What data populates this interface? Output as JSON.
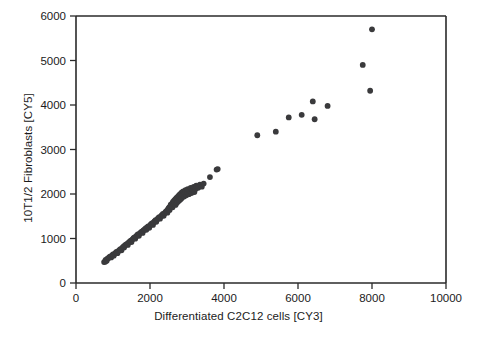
{
  "chart_data": {
    "type": "scatter",
    "title": "",
    "xlabel": "Differentiated C2C12 cells [CY3]",
    "ylabel": "10T1/2 Fibroblasts [CY5]",
    "xlim": [
      0,
      10000
    ],
    "ylim": [
      0,
      6000
    ],
    "xticks": [
      0,
      2000,
      4000,
      6000,
      8000,
      10000
    ],
    "yticks": [
      0,
      1000,
      2000,
      3000,
      4000,
      5000,
      6000
    ],
    "xtick_labels": [
      "0",
      "2000",
      "4000",
      "6000",
      "8000",
      "10000"
    ],
    "ytick_labels": [
      "0",
      "1000",
      "2000",
      "3000",
      "4000",
      "5000",
      "6000"
    ],
    "grid": false,
    "legend": false,
    "marker": "circle",
    "marker_color": "#3a3a3c",
    "marker_size": 5,
    "series": [
      {
        "name": "samples",
        "points": [
          [
            760,
            470
          ],
          [
            790,
            480
          ],
          [
            800,
            520
          ],
          [
            830,
            500
          ],
          [
            850,
            545
          ],
          [
            880,
            560
          ],
          [
            900,
            580
          ],
          [
            930,
            600
          ],
          [
            950,
            575
          ],
          [
            980,
            620
          ],
          [
            1000,
            640
          ],
          [
            1020,
            615
          ],
          [
            1050,
            660
          ],
          [
            1080,
            685
          ],
          [
            1100,
            700
          ],
          [
            1120,
            670
          ],
          [
            1150,
            720
          ],
          [
            1180,
            745
          ],
          [
            1200,
            760
          ],
          [
            1230,
            735
          ],
          [
            1250,
            790
          ],
          [
            1280,
            815
          ],
          [
            1300,
            800
          ],
          [
            1320,
            845
          ],
          [
            1350,
            860
          ],
          [
            1380,
            880
          ],
          [
            1400,
            855
          ],
          [
            1420,
            905
          ],
          [
            1450,
            930
          ],
          [
            1480,
            950
          ],
          [
            1500,
            920
          ],
          [
            1520,
            975
          ],
          [
            1550,
            1000
          ],
          [
            1570,
            1020
          ],
          [
            1600,
            995
          ],
          [
            1620,
            1045
          ],
          [
            1650,
            1070
          ],
          [
            1670,
            1090
          ],
          [
            1700,
            1060
          ],
          [
            1720,
            1110
          ],
          [
            1750,
            1135
          ],
          [
            1780,
            1155
          ],
          [
            1800,
            1125
          ],
          [
            1820,
            1180
          ],
          [
            1850,
            1200
          ],
          [
            1880,
            1225
          ],
          [
            1900,
            1195
          ],
          [
            1920,
            1250
          ],
          [
            1950,
            1270
          ],
          [
            1980,
            1240
          ],
          [
            2000,
            1290
          ],
          [
            2020,
            1315
          ],
          [
            2050,
            1340
          ],
          [
            2080,
            1305
          ],
          [
            2100,
            1360
          ],
          [
            2120,
            1385
          ],
          [
            2150,
            1410
          ],
          [
            2170,
            1375
          ],
          [
            2200,
            1430
          ],
          [
            2220,
            1455
          ],
          [
            2250,
            1480
          ],
          [
            2270,
            1445
          ],
          [
            2300,
            1500
          ],
          [
            2320,
            1525
          ],
          [
            2350,
            1550
          ],
          [
            2370,
            1510
          ],
          [
            2400,
            1570
          ],
          [
            2420,
            1595
          ],
          [
            2450,
            1620
          ],
          [
            2470,
            1580
          ],
          [
            2480,
            1650
          ],
          [
            2500,
            1675
          ],
          [
            2520,
            1700
          ],
          [
            2530,
            1640
          ],
          [
            2550,
            1720
          ],
          [
            2560,
            1760
          ],
          [
            2580,
            1735
          ],
          [
            2600,
            1790
          ],
          [
            2610,
            1700
          ],
          [
            2620,
            1820
          ],
          [
            2640,
            1775
          ],
          [
            2650,
            1850
          ],
          [
            2660,
            1810
          ],
          [
            2680,
            1880
          ],
          [
            2690,
            1755
          ],
          [
            2700,
            1840
          ],
          [
            2710,
            1905
          ],
          [
            2720,
            1795
          ],
          [
            2730,
            1870
          ],
          [
            2740,
            1930
          ],
          [
            2750,
            1825
          ],
          [
            2760,
            1890
          ],
          [
            2770,
            1960
          ],
          [
            2780,
            1850
          ],
          [
            2790,
            1915
          ],
          [
            2800,
            1985
          ],
          [
            2810,
            1870
          ],
          [
            2820,
            1940
          ],
          [
            2830,
            2010
          ],
          [
            2840,
            1895
          ],
          [
            2850,
            1965
          ],
          [
            2860,
            2035
          ],
          [
            2870,
            1920
          ],
          [
            2880,
            1990
          ],
          [
            2900,
            2060
          ],
          [
            2920,
            1945
          ],
          [
            2940,
            2015
          ],
          [
            2960,
            2085
          ],
          [
            2980,
            1970
          ],
          [
            3000,
            2040
          ],
          [
            3020,
            2110
          ],
          [
            3050,
            1995
          ],
          [
            3080,
            2065
          ],
          [
            3100,
            2135
          ],
          [
            3120,
            2020
          ],
          [
            3150,
            2090
          ],
          [
            3180,
            2160
          ],
          [
            3200,
            2045
          ],
          [
            3230,
            2115
          ],
          [
            3250,
            2185
          ],
          [
            3300,
            2140
          ],
          [
            3350,
            2210
          ],
          [
            3400,
            2165
          ],
          [
            3450,
            2235
          ],
          [
            3620,
            2380
          ],
          [
            3800,
            2550
          ],
          [
            3830,
            2560
          ],
          [
            4900,
            3320
          ],
          [
            5400,
            3400
          ],
          [
            5750,
            3720
          ],
          [
            6100,
            3780
          ],
          [
            6400,
            4080
          ],
          [
            6450,
            3680
          ],
          [
            6800,
            3980
          ],
          [
            7750,
            4900
          ],
          [
            7950,
            4320
          ],
          [
            8000,
            5700
          ]
        ]
      }
    ]
  }
}
